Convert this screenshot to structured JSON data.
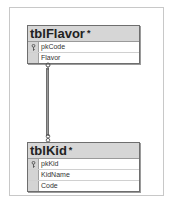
{
  "diagram": {
    "tables": [
      {
        "name": "tblFlavor",
        "modified_marker": "*",
        "columns": [
          {
            "name": "pkCode",
            "is_key": true
          },
          {
            "name": "Flavor",
            "is_key": false
          }
        ]
      },
      {
        "name": "tblKid",
        "modified_marker": "*",
        "columns": [
          {
            "name": "pkKid",
            "is_key": true
          },
          {
            "name": "KidName",
            "is_key": false
          },
          {
            "name": "Code",
            "is_key": false
          }
        ]
      }
    ],
    "relationship": {
      "from": "tblFlavor.pkCode",
      "to": "tblKid.Code",
      "from_end": "key-icon",
      "to_end": "infinity-icon"
    }
  }
}
